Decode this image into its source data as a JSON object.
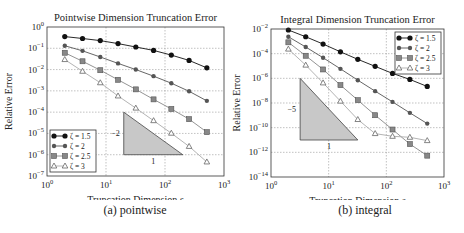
{
  "figure": {
    "captions": [
      "(a) pointwise",
      "(b) integral"
    ]
  },
  "chart_data": [
    {
      "type": "line",
      "title": "Pointwise Dimension Truncation Error",
      "xlabel": "Truncation Dimension s",
      "ylabel": "Relative Error",
      "xscale": "log",
      "yscale": "log",
      "xlim": [
        1,
        1000
      ],
      "ylim_exp": [
        -7,
        0
      ],
      "xticks": [
        "10^0",
        "10^1",
        "10^2",
        "10^3"
      ],
      "yticks": [
        "10^0",
        "10^-1",
        "10^-2",
        "10^-3",
        "10^-4",
        "10^-5",
        "10^-6",
        "10^-7"
      ],
      "grid": true,
      "legend_position": "lower left",
      "x": [
        2,
        4,
        8,
        16,
        32,
        64,
        128,
        256,
        512
      ],
      "series": [
        {
          "name": "ζ = 1.5",
          "marker": "circle",
          "color": "#111111",
          "log10_values": [
            -0.45,
            -0.54,
            -0.64,
            -0.78,
            -0.94,
            -1.1,
            -1.32,
            -1.57,
            -1.92
          ]
        },
        {
          "name": "ζ = 2",
          "marker": "circle-small",
          "color": "#555555",
          "log10_values": [
            -0.88,
            -1.12,
            -1.41,
            -1.71,
            -2.0,
            -2.31,
            -2.64,
            -3.02,
            -3.47
          ]
        },
        {
          "name": "ζ = 2.5",
          "marker": "square",
          "color": "#888888",
          "log10_values": [
            -1.21,
            -1.61,
            -2.03,
            -2.48,
            -2.93,
            -3.4,
            -3.85,
            -4.33,
            -4.94
          ]
        },
        {
          "name": "ζ = 3",
          "marker": "triangle",
          "color": "#aaaaaa",
          "log10_values": [
            -1.53,
            -2.08,
            -2.62,
            -3.24,
            -3.81,
            -4.4,
            -4.99,
            -5.61,
            -6.34
          ]
        }
      ],
      "slope_triangle": {
        "slope_label": "-2",
        "run_label": "1",
        "x_left": 20,
        "x_right": 200,
        "y_top_exp": -4,
        "y_bottom_exp": -6
      }
    },
    {
      "type": "line",
      "title": "Integral Dimension Truncation Error",
      "xlabel": "Truncation Dimension s",
      "ylabel": "Relative Error",
      "xscale": "log",
      "yscale": "log",
      "xlim": [
        1,
        1000
      ],
      "ylim_exp": [
        -14,
        -2
      ],
      "xticks": [
        "10^0",
        "10^1",
        "10^2",
        "10^3"
      ],
      "yticks": [
        "10^-2",
        "10^-4",
        "10^-6",
        "10^-8",
        "10^-10",
        "10^-12",
        "10^-14"
      ],
      "grid": true,
      "legend_position": "upper right",
      "x": [
        2,
        4,
        8,
        16,
        32,
        64,
        128,
        256,
        512
      ],
      "series": [
        {
          "name": "ζ = 1.5",
          "marker": "circle",
          "color": "#111111",
          "log10_values": [
            -2.08,
            -2.63,
            -3.22,
            -3.85,
            -4.46,
            -5.03,
            -5.6,
            -6.09,
            -6.66
          ]
        },
        {
          "name": "ζ = 2",
          "marker": "circle-small",
          "color": "#555555",
          "log10_values": [
            -2.63,
            -3.46,
            -4.33,
            -5.23,
            -6.15,
            -7.04,
            -7.91,
            -8.8,
            -9.67
          ]
        },
        {
          "name": "ζ = 2.5",
          "marker": "square",
          "color": "#888888",
          "log10_values": [
            -3.08,
            -4.17,
            -5.28,
            -6.55,
            -7.77,
            -8.99,
            -10.15,
            -11.33,
            -12.27
          ]
        },
        {
          "name": "ζ = 3",
          "marker": "triangle",
          "color": "#aaaaaa",
          "log10_values": [
            -3.63,
            -4.93,
            -6.37,
            -7.85,
            -9.34,
            -10.48,
            -10.7,
            -10.78,
            -11.05
          ]
        }
      ],
      "slope_triangle": {
        "slope_label": "-5",
        "run_label": "1",
        "x_left": 3.2,
        "x_right": 32,
        "y_top_exp": -6,
        "y_bottom_exp": -11
      }
    }
  ]
}
